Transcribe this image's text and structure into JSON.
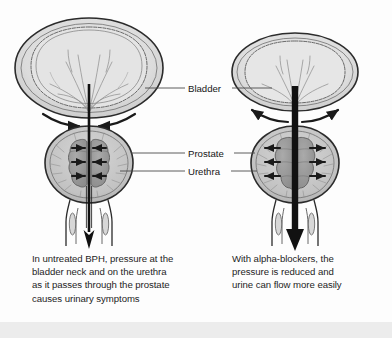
{
  "figure": {
    "type": "medical-anatomical-diagram",
    "background_color": "#fdfdfd",
    "bottom_band_color": "#ececec"
  },
  "annotations": {
    "bladder": "Bladder",
    "prostate": "Prostate",
    "urethra": "Urethra"
  },
  "panels": {
    "left": {
      "id": "untreated-bph",
      "caption": "In untreated BPH, pressure at the\nbladder neck and on the urethra\nas it passes through the prostate\ncauses urinary symptoms",
      "urethra_state": "narrow",
      "arrow_direction": "inward",
      "bladder_size": "large"
    },
    "right": {
      "id": "alpha-blocker-treated",
      "caption": "With alpha-blockers, the\npressure is reduced and\nurine can flow more easily",
      "urethra_state": "wide-open",
      "arrow_direction": "outward",
      "bladder_size": "smaller"
    }
  },
  "colors": {
    "outline": "#2b2b2b",
    "bladder_wall": "#cfcfcf",
    "bladder_lumen": "#e2e2e2",
    "prostate_body": "#c6c6c6",
    "prostate_lobe": "#9a9a9a",
    "arrow": "#1a1a1a",
    "leader_line": "#4a4a4a",
    "text": "#1d1d1d"
  }
}
